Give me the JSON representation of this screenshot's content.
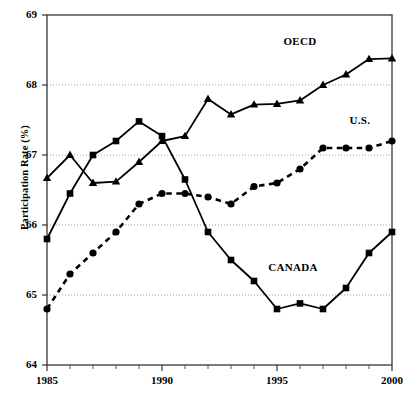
{
  "chart_data": {
    "type": "line",
    "title": "",
    "xlabel": "",
    "ylabel": "Participation Rate (%)",
    "x": [
      1985,
      1986,
      1987,
      1988,
      1989,
      1990,
      1991,
      1992,
      1993,
      1994,
      1995,
      1996,
      1997,
      1998,
      1999,
      2000
    ],
    "xlim": [
      1985,
      2000
    ],
    "ylim": [
      64,
      69
    ],
    "x_ticks": [
      1985,
      1990,
      1995,
      2000
    ],
    "x_tick_labels": [
      "1985",
      "1990",
      "1995",
      "2000"
    ],
    "x_minor_ticks": [
      1986,
      1987,
      1988,
      1989,
      1991,
      1992,
      1993,
      1994,
      1996,
      1997,
      1998,
      1999
    ],
    "y_ticks": [
      64,
      65,
      66,
      67,
      68,
      69
    ],
    "y_tick_labels": [
      "64",
      "65",
      "66",
      "67",
      "68",
      "69"
    ],
    "grid": "horizontal-dotted",
    "legend_position": "inline-annotations",
    "series": [
      {
        "name": "OECD",
        "marker": "triangle",
        "line_style": "solid",
        "color": "#000000",
        "label_text": "OECD",
        "values": [
          66.67,
          67.0,
          66.6,
          66.62,
          66.9,
          67.2,
          67.27,
          67.8,
          67.58,
          67.72,
          67.73,
          67.78,
          68.0,
          68.15,
          68.37,
          68.38
        ]
      },
      {
        "name": "CANADA",
        "marker": "square",
        "line_style": "solid",
        "color": "#000000",
        "label_text": "CANADA",
        "values": [
          65.8,
          66.45,
          67.0,
          67.2,
          67.48,
          67.27,
          66.65,
          65.9,
          65.5,
          65.2,
          64.8,
          64.88,
          64.8,
          65.1,
          65.6,
          65.9
        ]
      },
      {
        "name": "U.S.",
        "marker": "circle",
        "line_style": "dashed",
        "color": "#000000",
        "label_text": "U.S.",
        "values": [
          64.8,
          65.3,
          65.6,
          65.9,
          66.3,
          66.45,
          66.45,
          66.4,
          66.3,
          66.55,
          66.6,
          66.8,
          67.1,
          67.1,
          67.1,
          67.2
        ]
      }
    ],
    "annotations": [
      {
        "text": "OECD",
        "x": 1996.0,
        "y": 68.62
      },
      {
        "text": "U.S.",
        "x": 1998.6,
        "y": 67.48
      },
      {
        "text": "CANADA",
        "x": 1995.7,
        "y": 65.38
      }
    ]
  },
  "axis": {
    "y_title": "Participation Rate (%)"
  }
}
